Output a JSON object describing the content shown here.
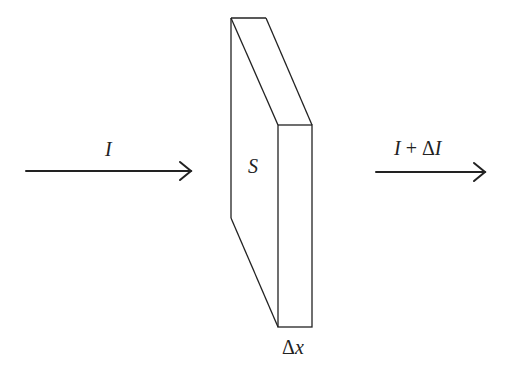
{
  "diagram": {
    "incoming_label": "I",
    "outgoing_label": "I + ΔI",
    "face_label": "S",
    "thickness_label": "Δx",
    "stroke_color": "#222222"
  }
}
